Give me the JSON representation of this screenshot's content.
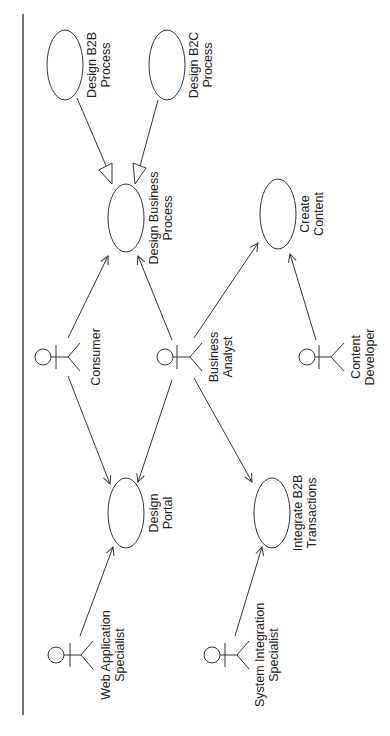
{
  "diagram": {
    "type": "UML use case diagram",
    "orientation": "rotated 90° counter-clockwise (labels read bottom-to-top)",
    "colors": {
      "line": "#333333",
      "background": "#ffffff",
      "text": "#222222"
    },
    "use_cases": [
      {
        "id": "uc_b2b",
        "line1": "Design B2B",
        "line2": "Process"
      },
      {
        "id": "uc_b2c",
        "line1": "Design B2C",
        "line2": "Process"
      },
      {
        "id": "uc_dbp",
        "line1": "Design Business",
        "line2": "Process"
      },
      {
        "id": "uc_cc",
        "line1": "Create",
        "line2": "Content"
      },
      {
        "id": "uc_dp",
        "line1": "Design",
        "line2": "Portal"
      },
      {
        "id": "uc_ib2b",
        "line1": "Integrate B2B",
        "line2": "Transactions"
      }
    ],
    "actors": [
      {
        "id": "a_consumer",
        "line1": "Consumer",
        "line2": ""
      },
      {
        "id": "a_ba",
        "line1": "Business",
        "line2": "Analyst"
      },
      {
        "id": "a_cd",
        "line1": "Content",
        "line2": "Developer"
      },
      {
        "id": "a_was",
        "line1": "Web Application",
        "line2": "Specialist"
      },
      {
        "id": "a_sis",
        "line1": "System Integration",
        "line2": "Specialist"
      }
    ],
    "relationships": [
      {
        "from": "Design B2B Process",
        "to": "Design Business Process",
        "kind": "generalization"
      },
      {
        "from": "Design B2C Process",
        "to": "Design Business Process",
        "kind": "generalization"
      },
      {
        "from": "Consumer",
        "to": "Design Business Process",
        "kind": "association"
      },
      {
        "from": "Consumer",
        "to": "Design Portal",
        "kind": "association"
      },
      {
        "from": "Business Analyst",
        "to": "Design Business Process",
        "kind": "association"
      },
      {
        "from": "Business Analyst",
        "to": "Create Content",
        "kind": "association"
      },
      {
        "from": "Business Analyst",
        "to": "Design Portal",
        "kind": "association"
      },
      {
        "from": "Business Analyst",
        "to": "Integrate B2B Transactions",
        "kind": "association"
      },
      {
        "from": "Content Developer",
        "to": "Create Content",
        "kind": "association"
      },
      {
        "from": "Web Application Specialist",
        "to": "Design Portal",
        "kind": "association"
      },
      {
        "from": "System Integration Specialist",
        "to": "Integrate B2B Transactions",
        "kind": "association"
      }
    ]
  }
}
